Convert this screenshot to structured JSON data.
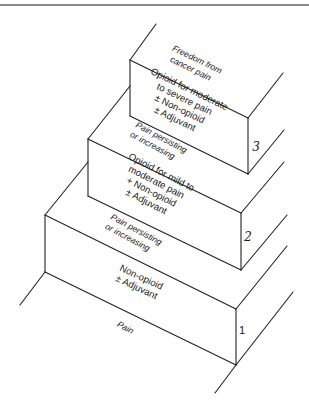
{
  "diagram": {
    "type": "staircase",
    "base_label": "Pain",
    "top_label_line1": "Freedom from",
    "top_label_line2": "cancer pain",
    "steps": [
      {
        "number": "1",
        "lines": [
          "Non-opioid",
          "± Adjuvant"
        ]
      },
      {
        "number": "2",
        "lines": [
          "Opioid for mild to",
          "moderate pain",
          "+ Non-opioid",
          "± Adjuvant"
        ]
      },
      {
        "number": "3",
        "lines": [
          "Opioid for moderate",
          "to severe pain",
          "± Non-opioid",
          "± Adjuvant"
        ]
      }
    ],
    "transitions": [
      {
        "line1": "Pain persisting",
        "line2": "or increasing"
      },
      {
        "line1": "Pain persisting",
        "line2": "or increasing"
      }
    ]
  }
}
